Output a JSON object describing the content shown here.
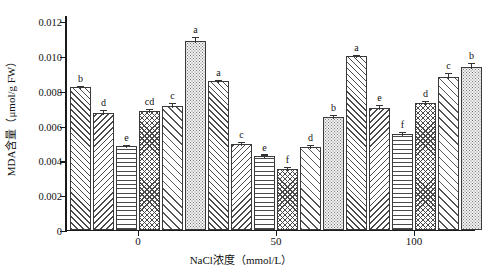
{
  "chart_data": {
    "type": "bar",
    "title": "",
    "xlabel": "NaCl浓度（mmol/L）",
    "ylabel": "MDA含量（μmol/g FW）",
    "categories": [
      "0",
      "50",
      "100"
    ],
    "ylim": [
      0,
      0.012
    ],
    "ytick_labels": [
      "0",
      "0.002",
      "0.004",
      "0.006",
      "0.008",
      "0.010",
      "0.012"
    ],
    "ytick_values": [
      0,
      0.002,
      0.004,
      0.006,
      0.008,
      0.01,
      0.012
    ],
    "grid": false,
    "legend": "none",
    "series": [
      {
        "name": "treatment-1",
        "pattern": "forward-diagonal-hatch",
        "values": [
          0.0082,
          0.00855,
          0.00998
        ],
        "errors": [
          0.00012,
          0.0001,
          0.00012
        ],
        "sig_labels": [
          "b",
          "a",
          "a"
        ]
      },
      {
        "name": "treatment-2",
        "pattern": "backward-diagonal-hatch",
        "values": [
          0.0067,
          0.00492,
          0.007
        ],
        "errors": [
          0.00022,
          0.00018,
          0.00022
        ],
        "sig_labels": [
          "d",
          "c",
          "e"
        ]
      },
      {
        "name": "treatment-3",
        "pattern": "horizontal-lines",
        "values": [
          0.00482,
          0.00425,
          0.0055
        ],
        "errors": [
          0.00013,
          0.00014,
          0.00016
        ],
        "sig_labels": [
          "e",
          "e",
          "f"
        ]
      },
      {
        "name": "treatment-4",
        "pattern": "crosshatch-checker",
        "values": [
          0.00682,
          0.00352,
          0.0073
        ],
        "errors": [
          0.00016,
          0.00014,
          0.00016
        ],
        "sig_labels": [
          "cd",
          "f",
          "d"
        ]
      },
      {
        "name": "treatment-5",
        "pattern": "sparse-forward-diagonal",
        "values": [
          0.00712,
          0.00475,
          0.0088
        ],
        "errors": [
          0.00022,
          0.00018,
          0.00026
        ],
        "sig_labels": [
          "c",
          "d",
          "c"
        ]
      },
      {
        "name": "treatment-6",
        "pattern": "stipple-dots",
        "values": [
          0.01085,
          0.0065,
          0.00935
        ],
        "errors": [
          0.0003,
          0.00018,
          0.00028
        ],
        "sig_labels": [
          "a",
          "b",
          "b"
        ]
      }
    ]
  }
}
